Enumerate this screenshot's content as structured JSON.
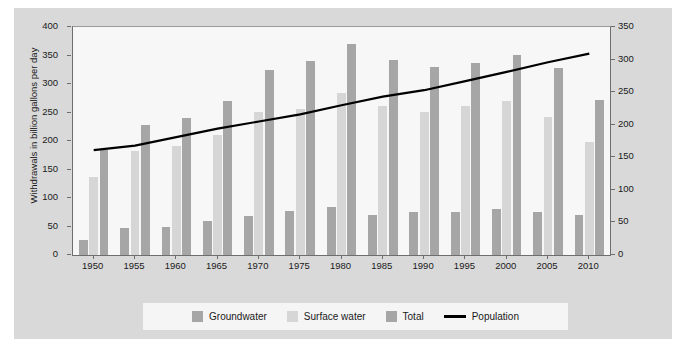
{
  "figure": {
    "background_color": "#d9d9d9",
    "plot_background_color": "#f7f7f7",
    "legend_background_color": "#f5f5f5"
  },
  "colors": {
    "groundwater": "#a6a6a6",
    "surface_water": "#d6d6d6",
    "total": "#a6a6a6",
    "population_line": "#000000",
    "axis": "#6e6e6e",
    "text": "#1a1a1a"
  },
  "legend": {
    "items": [
      {
        "label": "Groundwater",
        "type": "swatch",
        "color": "#a6a6a6"
      },
      {
        "label": "Surface water",
        "type": "swatch",
        "color": "#d6d6d6"
      },
      {
        "label": "Total",
        "type": "swatch",
        "color": "#a6a6a6"
      },
      {
        "label": "Population",
        "type": "line",
        "color": "#000000"
      }
    ]
  },
  "chart_data": {
    "type": "bar",
    "title": "",
    "subtitle": "",
    "xlabel": "",
    "ylabel": "Withdrawals in billion gallons per day",
    "y2label": "Population, in millions",
    "ylim": [
      0,
      400
    ],
    "y2lim": [
      0,
      350
    ],
    "yticks": [
      0,
      50,
      100,
      150,
      200,
      250,
      300,
      350,
      400
    ],
    "y2ticks": [
      0,
      50,
      100,
      150,
      200,
      250,
      300,
      350
    ],
    "grid": false,
    "legend_position": "bottom",
    "categories": [
      "1950",
      "1955",
      "1960",
      "1965",
      "1970",
      "1975",
      "1980",
      "1985",
      "1990",
      "1995",
      "2000",
      "2005",
      "2010"
    ],
    "series": [
      {
        "name": "Groundwater",
        "axis": "left",
        "units": "billion gallons per day",
        "color": "#a6a6a6",
        "values": [
          27,
          47,
          50,
          60,
          68,
          77,
          84,
          70,
          76,
          75,
          80,
          76,
          70
        ]
      },
      {
        "name": "Surface water",
        "axis": "left",
        "units": "billion gallons per day",
        "color": "#d6d6d6",
        "values": [
          136,
          183,
          191,
          210,
          251,
          257,
          285,
          262,
          251,
          262,
          270,
          243,
          198
        ]
      },
      {
        "name": "Total",
        "axis": "left",
        "units": "billion gallons per day",
        "color": "#a6a6a6",
        "values": [
          185,
          228,
          241,
          271,
          325,
          340,
          370,
          343,
          330,
          336,
          351,
          328,
          272
        ]
      },
      {
        "name": "Population",
        "axis": "right",
        "type": "line",
        "units": "millions",
        "color": "#000000",
        "values": [
          161,
          168,
          181,
          194,
          205,
          216,
          230,
          243,
          253,
          267,
          281,
          296,
          309
        ]
      }
    ]
  }
}
